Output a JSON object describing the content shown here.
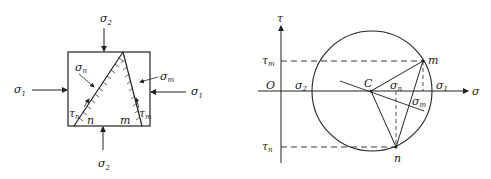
{
  "left_diagram": {
    "labels": {
      "sigma2_top": "σ",
      "sigma2_top_sub": "2",
      "sigma2_bottom": "σ",
      "sigma2_bottom_sub": "2",
      "sigma1_left": "σ",
      "sigma1_left_sub": "1",
      "sigma1_right": "σ",
      "sigma1_right_sub": "1",
      "sigma_n": "σ",
      "sigma_n_sub": "n",
      "sigma_m": "σ",
      "sigma_m_sub": "m",
      "tau_n": "τ",
      "tau_n_sub": "n",
      "tau_m": "τ",
      "tau_m_sub": "m",
      "plane_n": "n",
      "plane_m": "m"
    }
  },
  "right_diagram": {
    "labels": {
      "tau_axis": "τ",
      "sigma_axis": "σ",
      "origin": "O",
      "center": "C",
      "sigma2": "σ",
      "sigma2_sub": "2",
      "sigma1": "σ",
      "sigma1_sub": "1",
      "tau_m": "τ",
      "tau_m_sub": "m",
      "tau_n": "τ",
      "tau_n_sub": "n",
      "sigma_n": "σ",
      "sigma_n_sub": "n",
      "sigma_m": "σ",
      "sigma_m_sub": "m",
      "point_m": "m",
      "point_n": "n"
    }
  },
  "colors": {
    "stroke": "#222222",
    "background": "#ffffff"
  }
}
